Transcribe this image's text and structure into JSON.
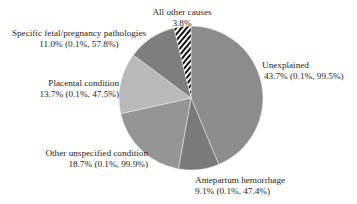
{
  "chart_data": {
    "type": "pie",
    "title": "",
    "start_angle_deg": 0,
    "direction": "clockwise",
    "slices": [
      {
        "label": "Unexplained",
        "value": 43.7,
        "ci": "(0.1%, 99.5%)",
        "display": "43.7% (0.1%, 99.5%)",
        "color": "#8c8c8c",
        "pattern": "none"
      },
      {
        "label": "Antepartum hemorrhage",
        "value": 9.1,
        "ci": "(0.1%, 47.4%)",
        "display": "9.1% (0.1%, 47.4%)",
        "color": "#7a7a7a",
        "pattern": "none"
      },
      {
        "label": "Other unspecified condition",
        "value": 18.7,
        "ci": "(0.1%, 99.9%)",
        "display": "18.7% (0.1%, 99.9%)",
        "color": "#959595",
        "pattern": "none"
      },
      {
        "label": "Placental condition",
        "value": 13.7,
        "ci": "(0.1%, 47.5%)",
        "display": "13.7% (0.1%, 47.5%)",
        "color": "#b9b9b9",
        "pattern": "none"
      },
      {
        "label": "Specific fetal/pregnancy pathologies",
        "value": 11.0,
        "ci": "(0.1%, 57.8%)",
        "display": "11.0% (0.1%, 57.8%)",
        "color": "#7e7e7e",
        "pattern": "none"
      },
      {
        "label": "All other causes",
        "value": 3.8,
        "ci": "",
        "display": "3.8%",
        "color": "#111111",
        "pattern": "diagonal-stripes"
      }
    ],
    "legend": "none (direct labels)"
  },
  "labels": {
    "unexplained": {
      "name": "Unexplained",
      "value": "43.7% (0.1%, 99.5%)"
    },
    "antepartum": {
      "name": "Antepartum hemorrhage",
      "value": "9.1% (0.1%, 47.4%)"
    },
    "other_unspecified": {
      "name": "Other unspecified condition",
      "value": "18.7% (0.1%, 99.9%)"
    },
    "placental": {
      "name": "Placental condition",
      "value": "13.7% (0.1%, 47.5%)"
    },
    "specific_fetal": {
      "name": "Specific fetal/pregnancy pathologies",
      "value": "11.0% (0.1%, 57.8%)"
    },
    "all_other": {
      "name": "All other causes",
      "value": "3.8%"
    }
  }
}
